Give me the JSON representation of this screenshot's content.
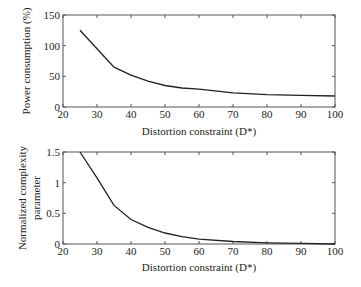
{
  "chart_data": [
    {
      "type": "line",
      "title": "",
      "xlabel": "Distortion constraint (D*)",
      "ylabel": "Power consumption (%)",
      "xlim": [
        20,
        100
      ],
      "ylim": [
        0,
        150
      ],
      "xticks": [
        20,
        30,
        40,
        50,
        60,
        70,
        80,
        90,
        100
      ],
      "yticks": [
        0,
        50,
        100,
        150
      ],
      "grid": false,
      "legend": null,
      "series": [
        {
          "name": "Power consumption",
          "x": [
            25,
            30,
            35,
            40,
            45,
            50,
            55,
            60,
            70,
            80,
            90,
            100
          ],
          "y": [
            125,
            95,
            65,
            52,
            42,
            35,
            31,
            29,
            23,
            20,
            19,
            18
          ]
        }
      ]
    },
    {
      "type": "line",
      "title": "",
      "xlabel": "Distortion constraint (D*)",
      "ylabel": "Normalized complexity parameter",
      "xlim": [
        20,
        100
      ],
      "ylim": [
        0,
        1.5
      ],
      "xticks": [
        20,
        30,
        40,
        50,
        60,
        70,
        80,
        90,
        100
      ],
      "yticks": [
        0,
        0.5,
        1,
        1.5
      ],
      "grid": false,
      "legend": null,
      "series": [
        {
          "name": "Normalized complexity parameter",
          "x": [
            25,
            30,
            35,
            40,
            45,
            50,
            55,
            60,
            70,
            80,
            90,
            100
          ],
          "y": [
            1.5,
            1.08,
            0.63,
            0.4,
            0.27,
            0.18,
            0.12,
            0.08,
            0.04,
            0.02,
            0.01,
            0.0
          ]
        }
      ]
    }
  ],
  "charts": {
    "top": {
      "ylabel": "Power consumption (%)",
      "xlabel": "Distortion constraint (D*)",
      "yticklabels": [
        "150",
        "100",
        "50",
        "0"
      ],
      "xticklabels": [
        "20",
        "30",
        "40",
        "50",
        "60",
        "70",
        "80",
        "90",
        "100"
      ]
    },
    "bottom": {
      "ylabel_line1": "Normalized complexity",
      "ylabel_line2": "parameter",
      "xlabel": "Distortion constraint (D*)",
      "yticklabels": [
        "1.5",
        "1",
        "0.5",
        "0"
      ],
      "xticklabels": [
        "20",
        "30",
        "40",
        "50",
        "60",
        "70",
        "80",
        "90",
        "100"
      ]
    }
  }
}
